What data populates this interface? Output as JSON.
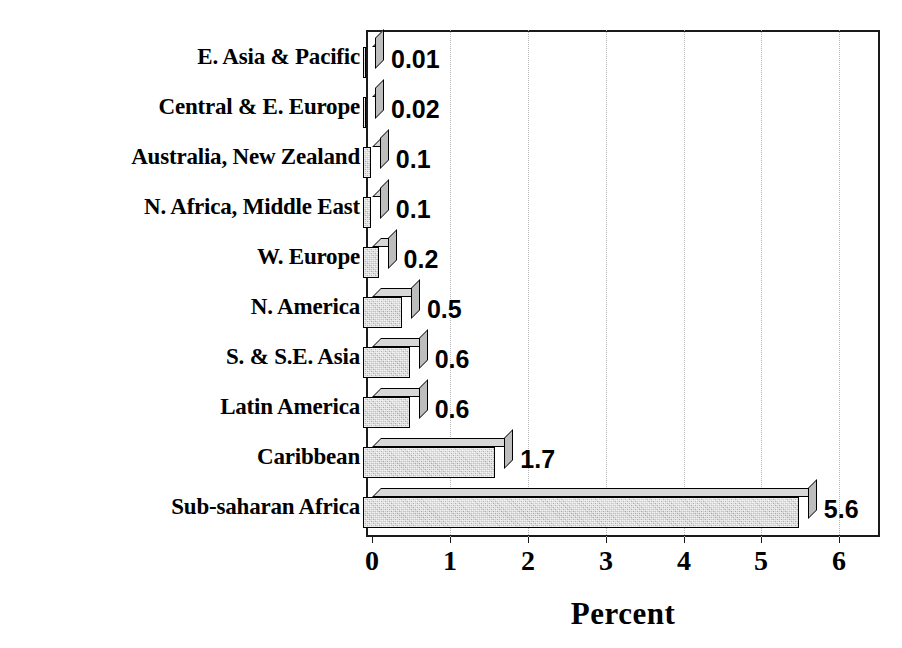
{
  "chart_data": {
    "type": "bar",
    "orientation": "horizontal",
    "title": "",
    "subtitle": "",
    "xlabel": "Percent",
    "ylabel": "",
    "xlim": [
      0,
      6
    ],
    "xticks": [
      "0",
      "1",
      "2",
      "3",
      "4",
      "5",
      "6"
    ],
    "grid": "vertical-dotted",
    "legend": "none",
    "categories": [
      "E. Asia & Pacific",
      "Central & E. Europe",
      "Australia, New Zealand",
      "N. Africa, Middle East",
      "W. Europe",
      "N. America",
      "S. & S.E. Asia",
      "Latin America",
      "Caribbean",
      "Sub-saharan Africa"
    ],
    "values": [
      0.01,
      0.02,
      0.1,
      0.1,
      0.2,
      0.5,
      0.6,
      0.6,
      1.7,
      5.6
    ],
    "value_labels": [
      "0.01",
      "0.02",
      "0.1",
      "0.1",
      "0.2",
      "0.5",
      "0.6",
      "0.6",
      "1.7",
      "5.6"
    ],
    "bar_style": {
      "effect": "3d",
      "fill": "#c9c9c9",
      "edge": "#000000",
      "top_face": "#d8d8d8",
      "side_face": "#bdbdbd"
    },
    "colors": {
      "background": "#ffffff",
      "frame": "#1a1a1a",
      "grid": "#b4b4b4",
      "text": "#000000"
    }
  }
}
